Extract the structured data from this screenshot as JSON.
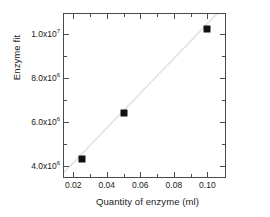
{
  "chart_data": {
    "type": "scatter",
    "title": "",
    "xlabel": "Quantity of enzyme (ml)",
    "ylabel": "Enzyme fit",
    "xlim": [
      0.0145,
      0.1105
    ],
    "ylim": [
      3500000,
      10900000
    ],
    "grid": false,
    "legend": null,
    "xticks": [
      {
        "value": 0.02,
        "label": "0.02"
      },
      {
        "value": 0.04,
        "label": "0.04"
      },
      {
        "value": 0.06,
        "label": "0.06"
      },
      {
        "value": 0.08,
        "label": "0.08"
      },
      {
        "value": 0.1,
        "label": "0.10"
      }
    ],
    "xminorticks": [
      0.03,
      0.05,
      0.07,
      0.09
    ],
    "yticks": [
      {
        "value": 4000000,
        "mantissa": "4.0x10",
        "exponent": "6"
      },
      {
        "value": 6000000,
        "mantissa": "6.0x10",
        "exponent": "6"
      },
      {
        "value": 8000000,
        "mantissa": "8.0x10",
        "exponent": "6"
      },
      {
        "value": 10000000,
        "mantissa": "1.0x10",
        "exponent": "7"
      }
    ],
    "yminorticks": [
      5000000,
      7000000,
      9000000
    ],
    "series": [
      {
        "name": "Enzyme fit",
        "marker": "filled-square",
        "marker_color": "#111111",
        "points": [
          {
            "x": 0.025,
            "y": 4300000
          },
          {
            "x": 0.05,
            "y": 6400000
          },
          {
            "x": 0.1,
            "y": 10200000
          }
        ]
      },
      {
        "name": "linear fit",
        "type": "line",
        "line_color": "#e3e3e3",
        "x": [
          0.0145,
          0.1105
        ],
        "y": [
          3620000,
          11200000
        ]
      }
    ]
  },
  "colors": {
    "axis": "#4a4a4a",
    "text": "#1a1a1a",
    "marker": "#111111",
    "fitline": "#e3e3e3",
    "background": "#ffffff"
  }
}
